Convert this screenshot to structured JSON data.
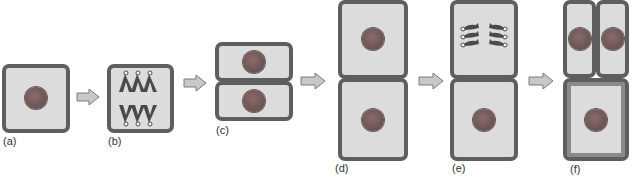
{
  "diagram": {
    "stages": [
      {
        "id": "a",
        "label": "(a)"
      },
      {
        "id": "b",
        "label": "(b)"
      },
      {
        "id": "c",
        "label": "(c)"
      },
      {
        "id": "d",
        "label": "(d)"
      },
      {
        "id": "e",
        "label": "(e)"
      },
      {
        "id": "f",
        "label": "(f)"
      }
    ],
    "connector": "right-arrow",
    "colors": {
      "cell_wall": "#5e5e5e",
      "cytoplasm": "#dcdcdc",
      "nucleus": "#6e5656",
      "chromosome": "#4a4a4a",
      "arrow_fill": "#c8c8c8",
      "arrow_stroke": "#7a7a7a"
    }
  }
}
